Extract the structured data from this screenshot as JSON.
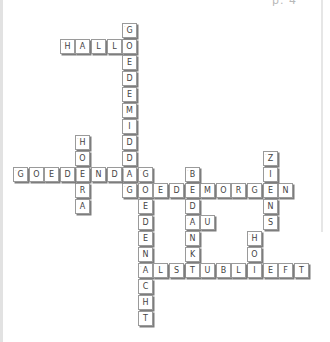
{
  "page": {
    "page_label": "p. 4",
    "cell_size": 16,
    "col_origin_x": 13,
    "col_step": 15.6,
    "row_origin_y": 23,
    "row_step": 16
  },
  "crossword": {
    "words": [
      {
        "word": "HALLO",
        "direction": "across",
        "col": 3,
        "row": 1
      },
      {
        "word": "GOEDEMIDDAG",
        "direction": "down",
        "col": 7,
        "row": 0
      },
      {
        "word": "HOERA",
        "direction": "down",
        "col": 4,
        "row": 7
      },
      {
        "word": "GOEDENDAG",
        "direction": "across",
        "col": 0,
        "row": 9
      },
      {
        "word": "GOEDEMORGEN",
        "direction": "across",
        "col": 7,
        "row": 10
      },
      {
        "word": "GOEDENACHT",
        "direction": "down",
        "col": 8,
        "row": 9
      },
      {
        "word": "BEDANKT",
        "direction": "down",
        "col": 11,
        "row": 9
      },
      {
        "word": "AU",
        "direction": "across",
        "col": 11,
        "row": 12
      },
      {
        "word": "ZIENS",
        "direction": "down",
        "col": 16,
        "row": 8
      },
      {
        "word": "HOI",
        "direction": "down",
        "col": 15,
        "row": 13
      },
      {
        "word": "ÄLSTUBLIEFT",
        "direction": "across",
        "col": 8,
        "row": 15
      }
    ]
  }
}
